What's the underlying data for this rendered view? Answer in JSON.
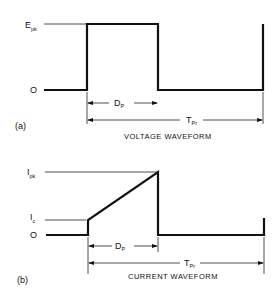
{
  "figure": {
    "panel_a": {
      "tag": "(a)",
      "caption": "VOLTAGE WAVEFORM",
      "y_labels": {
        "peak_main": "E",
        "peak_sub": "pk",
        "zero": "O"
      },
      "dims": {
        "width_main": "D",
        "width_sub": "P",
        "period_main": "T",
        "period_sub": "Pr"
      }
    },
    "panel_b": {
      "tag": "(b)",
      "caption": "CURRENT WAVEFORM",
      "y_labels": {
        "peak_main": "I",
        "peak_sub": "pk",
        "start_main": "I",
        "start_sub": "c",
        "zero": "O"
      },
      "dims": {
        "width_main": "D",
        "width_sub": "P",
        "period_main": "T",
        "period_sub": "Pr"
      }
    }
  }
}
